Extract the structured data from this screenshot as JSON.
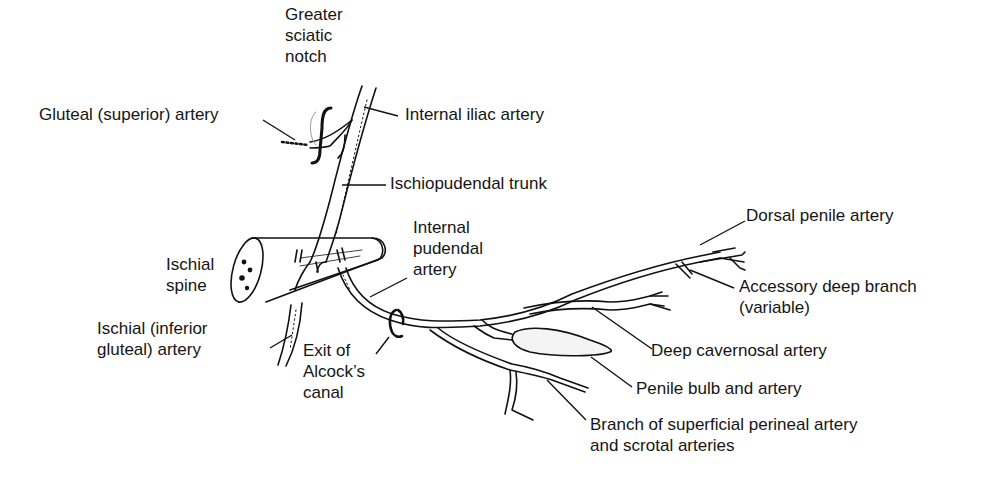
{
  "diagram": {
    "labels": {
      "greater_sciatic_notch": [
        "Greater",
        "sciatic",
        "notch"
      ],
      "gluteal_superior_artery": "Gluteal (superior) artery",
      "internal_iliac_artery": "Internal iliac artery",
      "ischiopudendal_trunk": "Ischiopudendal trunk",
      "ischial_spine": [
        "Ischial",
        "spine"
      ],
      "ischial_inferior_gluteal_artery": [
        "Ischial (inferior",
        "gluteal) artery"
      ],
      "internal_pudendal_artery": [
        "Internal",
        "pudendal",
        "artery"
      ],
      "exit_alcocks_canal": [
        "Exit of",
        "Alcock’s",
        "canal"
      ],
      "dorsal_penile_artery": "Dorsal penile artery",
      "accessory_deep_branch": [
        "Accessory deep branch",
        "(variable)"
      ],
      "deep_cavernosal_artery": "Deep cavernosal artery",
      "penile_bulb_and_artery": "Penile bulb and artery",
      "superficial_perineal_branch": [
        "Branch of superficial perineal artery",
        "and scrotal arteries"
      ]
    }
  }
}
